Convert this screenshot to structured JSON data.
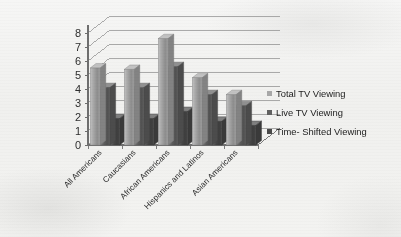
{
  "chart_data": {
    "type": "bar",
    "title": "",
    "subtitle": "",
    "xlabel": "",
    "ylabel": "",
    "ylim": [
      0,
      8
    ],
    "ytick_labels": [
      "0",
      "1",
      "2",
      "3",
      "4",
      "5",
      "6",
      "7",
      "8"
    ],
    "grid": true,
    "grid_axis": "y",
    "legend_position": "right",
    "style": "3d-clustered-column",
    "categories": [
      "All Americans",
      "Caucasians",
      "African Americans",
      "Hispanics and Latinos",
      "Asian Americans"
    ],
    "series": [
      {
        "name": "Total TV Viewing",
        "color": "#a8a8a8",
        "values": [
          5.5,
          5.4,
          7.6,
          4.8,
          3.6
        ]
      },
      {
        "name": "Live TV Viewing",
        "color": "#616161",
        "values": [
          4.1,
          4.1,
          5.6,
          3.6,
          2.8
        ]
      },
      {
        "name": "Time- Shifted Viewing",
        "color": "#4a4a4a",
        "values": [
          1.9,
          1.9,
          2.4,
          1.7,
          1.4
        ]
      }
    ]
  },
  "legend": {
    "items": [
      {
        "label": "Total TV Viewing",
        "color": "#a8a8a8"
      },
      {
        "label": "Live TV Viewing",
        "color": "#616161"
      },
      {
        "label": "Time- Shifted Viewing",
        "color": "#4a4a4a"
      }
    ]
  },
  "axes": {
    "y_ticks": [
      "8",
      "7",
      "6",
      "5",
      "4",
      "3",
      "2",
      "1",
      "0"
    ],
    "x_categories": [
      "All Americans",
      "Caucasians",
      "African Americans",
      "Hispanics and Latinos",
      "Asian Americans"
    ]
  },
  "colors": {
    "background": "#f2f2f0",
    "axis_line": "#6e6e6e",
    "grid_line": "#8a8a8a",
    "tick_text": "#2e2e2e",
    "series_1": "#a8a8a8",
    "series_2": "#616161",
    "series_3": "#4a4a4a"
  }
}
